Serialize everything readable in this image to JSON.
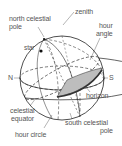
{
  "diagram": {
    "labels": {
      "north_celestial_pole_line1": "north celestial",
      "north_celestial_pole_line2": "pole",
      "zenith": "zenith",
      "hour_angle_line1": "hour",
      "hour_angle_line2": "angle",
      "star": "star",
      "north": "N",
      "south": "S",
      "horizon": "horizon",
      "celestial_equator_line1": "celestial",
      "celestial_equator_line2": "equator",
      "hour_circle": "hour circle",
      "south_celestial_pole_line1": "south celestial",
      "south_celestial_pole_line2": "pole"
    },
    "colors": {
      "line": "#222222",
      "label_text": "#555555",
      "wedge_fill": "#bdbdbd",
      "wedge_edge": "#444444",
      "background": "#ffffff"
    }
  }
}
